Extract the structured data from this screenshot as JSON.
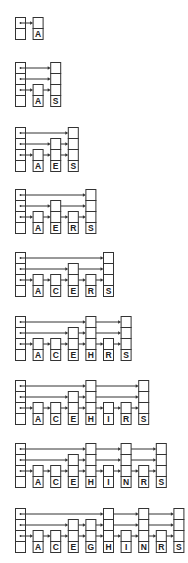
{
  "colors": {
    "stroke": "#333333",
    "background": "#ffffff",
    "label_fill": "#ffffff"
  },
  "layout": {
    "header_x": 15,
    "node_width": 10,
    "cell_height": 11,
    "node_pitch": 17.6
  },
  "diagrams": [
    {
      "step": 1,
      "top": 17,
      "header_levels": 1,
      "nodes": [
        {
          "key": "A",
          "levels": 1
        }
      ]
    },
    {
      "step": 2,
      "top": 62,
      "header_levels": 3,
      "nodes": [
        {
          "key": "A",
          "levels": 1
        },
        {
          "key": "S",
          "levels": 3
        }
      ]
    },
    {
      "step": 3,
      "top": 127,
      "header_levels": 3,
      "nodes": [
        {
          "key": "A",
          "levels": 1
        },
        {
          "key": "E",
          "levels": 2
        },
        {
          "key": "S",
          "levels": 3
        }
      ]
    },
    {
      "step": 4,
      "top": 189,
      "header_levels": 3,
      "nodes": [
        {
          "key": "A",
          "levels": 1
        },
        {
          "key": "E",
          "levels": 2
        },
        {
          "key": "R",
          "levels": 1
        },
        {
          "key": "S",
          "levels": 3
        }
      ]
    },
    {
      "step": 5,
      "top": 252,
      "header_levels": 3,
      "nodes": [
        {
          "key": "A",
          "levels": 1
        },
        {
          "key": "C",
          "levels": 1
        },
        {
          "key": "E",
          "levels": 2
        },
        {
          "key": "R",
          "levels": 1
        },
        {
          "key": "S",
          "levels": 3
        }
      ]
    },
    {
      "step": 6,
      "top": 316,
      "header_levels": 3,
      "nodes": [
        {
          "key": "A",
          "levels": 1
        },
        {
          "key": "C",
          "levels": 1
        },
        {
          "key": "E",
          "levels": 2
        },
        {
          "key": "H",
          "levels": 3
        },
        {
          "key": "R",
          "levels": 1
        },
        {
          "key": "S",
          "levels": 3
        }
      ]
    },
    {
      "step": 7,
      "top": 380,
      "header_levels": 3,
      "nodes": [
        {
          "key": "A",
          "levels": 1
        },
        {
          "key": "C",
          "levels": 1
        },
        {
          "key": "E",
          "levels": 2
        },
        {
          "key": "H",
          "levels": 3
        },
        {
          "key": "I",
          "levels": 1
        },
        {
          "key": "R",
          "levels": 1
        },
        {
          "key": "S",
          "levels": 3
        }
      ]
    },
    {
      "step": 8,
      "top": 443,
      "header_levels": 3,
      "nodes": [
        {
          "key": "A",
          "levels": 1
        },
        {
          "key": "C",
          "levels": 1
        },
        {
          "key": "E",
          "levels": 2
        },
        {
          "key": "H",
          "levels": 3
        },
        {
          "key": "I",
          "levels": 1
        },
        {
          "key": "N",
          "levels": 3
        },
        {
          "key": "R",
          "levels": 1
        },
        {
          "key": "S",
          "levels": 3
        }
      ]
    },
    {
      "step": 9,
      "top": 508,
      "header_levels": 3,
      "nodes": [
        {
          "key": "A",
          "levels": 1
        },
        {
          "key": "C",
          "levels": 1
        },
        {
          "key": "E",
          "levels": 2
        },
        {
          "key": "G",
          "levels": 2
        },
        {
          "key": "H",
          "levels": 3
        },
        {
          "key": "I",
          "levels": 1
        },
        {
          "key": "N",
          "levels": 3
        },
        {
          "key": "R",
          "levels": 1
        },
        {
          "key": "S",
          "levels": 3
        }
      ]
    }
  ]
}
